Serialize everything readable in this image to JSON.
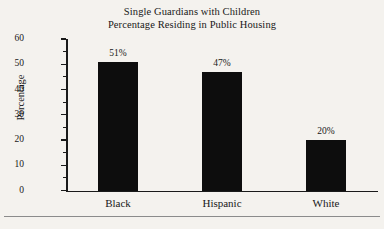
{
  "chart_data": {
    "type": "bar",
    "title": "Single Guardians with Children\nPercentage Residing in Public Housing",
    "title_lines": [
      "Single Guardians with Children",
      "Percentage Residing in Public Housing"
    ],
    "categories": [
      "Black",
      "Hispanic",
      "White"
    ],
    "values": [
      51,
      47,
      20
    ],
    "data_labels": [
      "51%",
      "47%",
      "20%"
    ],
    "xlabel": "",
    "ylabel": "Percentage",
    "ylim": [
      0,
      60
    ],
    "ytick_values": [
      0,
      10,
      20,
      30,
      40,
      50,
      60
    ],
    "ytick_labels": [
      "0",
      "10",
      "20",
      "30",
      "40",
      "50",
      "60"
    ],
    "minor_tick_values": [
      5,
      15,
      25,
      35,
      45,
      55
    ],
    "ytick_step": 10,
    "minor_tick_step": 5,
    "grid": false,
    "legend": null,
    "bar_color": "#0d0d0d",
    "axis_color": "#1a1a1a",
    "background_color": "#f4f2ee",
    "value_suffix": "%"
  },
  "footer": {
    "rule_color": "#8b8b8b"
  }
}
